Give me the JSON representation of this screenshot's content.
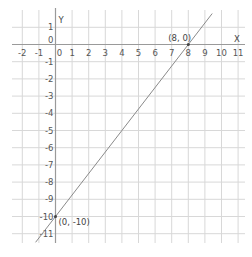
{
  "chart_data": {
    "type": "line",
    "title": "",
    "xlabel": "X",
    "ylabel": "Y",
    "xlim": [
      -2,
      11
    ],
    "ylim": [
      -11,
      1
    ],
    "grid": true,
    "x_ticks": [
      "-2",
      "-1",
      "0",
      "1",
      "2",
      "3",
      "4",
      "5",
      "6",
      "7",
      "8",
      "9",
      "10",
      "11"
    ],
    "y_ticks": [
      "1",
      "0",
      "-1",
      "-2",
      "-3",
      "-4",
      "-5",
      "-6",
      "-7",
      "-8",
      "-9",
      "-10",
      "-11"
    ],
    "series": [
      {
        "name": "y = 1.25x - 10",
        "x": [
          0,
          8
        ],
        "y": [
          -10,
          0
        ]
      }
    ],
    "annotations": [
      {
        "text": "(8, 0)",
        "x": 8,
        "y": 0
      },
      {
        "text": "(0, -10)",
        "x": 0,
        "y": -10
      }
    ]
  },
  "labels": {
    "x_axis": "X",
    "y_axis": "Y",
    "point_a": "(8, 0)",
    "point_b": "(0, -10)"
  }
}
